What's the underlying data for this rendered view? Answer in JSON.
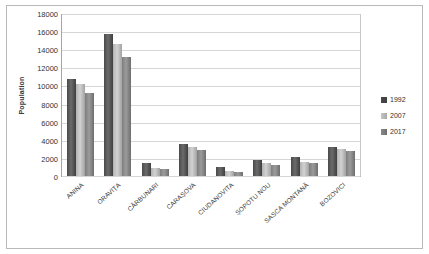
{
  "chart_data": {
    "type": "bar",
    "title": "",
    "xlabel": "",
    "ylabel": "Population",
    "ylim": [
      0,
      18000
    ],
    "yticks": [
      18000,
      16000,
      14000,
      12000,
      10000,
      8000,
      6000,
      4000,
      2000,
      0
    ],
    "grid": true,
    "legend_position": "right",
    "categories": [
      "ANINA",
      "ORAVIȚA",
      "CĂRBUNARI",
      "CARAȘOVA",
      "CIUDANOVITA",
      "ȘOPOTU NOU",
      "SASCA MONTANĂ",
      "BOZOVICI"
    ],
    "series": [
      {
        "name": "1992",
        "color": "#4a4a4a",
        "values": [
          10700,
          15700,
          1400,
          3500,
          1000,
          1800,
          2050,
          3250
        ]
      },
      {
        "name": "2007",
        "color": "#c6c6c6",
        "values": [
          10200,
          14600,
          900,
          3150,
          550,
          1400,
          1500,
          3000
        ]
      },
      {
        "name": "2017",
        "color": "#8a8a8a",
        "values": [
          9200,
          13100,
          800,
          2900,
          450,
          1200,
          1400,
          2800
        ]
      }
    ]
  }
}
